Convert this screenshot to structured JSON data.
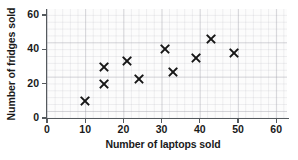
{
  "chart_data": {
    "type": "scatter",
    "title": "",
    "xlabel": "Number of laptops sold",
    "ylabel": "Number of fridges sold",
    "xlim": [
      0,
      63
    ],
    "ylim": [
      0,
      63
    ],
    "xticks": [
      0,
      10,
      20,
      30,
      40,
      50,
      60
    ],
    "xtick_labels": [
      "0",
      "10",
      "20",
      "30",
      "40",
      "50",
      "60"
    ],
    "yticks": [
      0,
      20,
      40,
      60
    ],
    "ytick_labels": [
      "0",
      "20",
      "40",
      "60"
    ],
    "grid": true,
    "grid_minor_step": 2,
    "grid_major_step": 10,
    "legend": null,
    "marker": "x",
    "marker_color": "#161616",
    "points": [
      {
        "x": 10,
        "y": 10
      },
      {
        "x": 15,
        "y": 20
      },
      {
        "x": 15,
        "y": 30
      },
      {
        "x": 21,
        "y": 33
      },
      {
        "x": 24,
        "y": 23
      },
      {
        "x": 31,
        "y": 40
      },
      {
        "x": 33,
        "y": 27
      },
      {
        "x": 39,
        "y": 35
      },
      {
        "x": 43,
        "y": 46
      },
      {
        "x": 49,
        "y": 38
      }
    ]
  },
  "colors": {
    "marker": "#161616",
    "axis": "#555a5e",
    "grid_major": "#96969f",
    "grid_minor": "#a0a0aa",
    "plot_background": "#fcfcfc",
    "page_background": "#ffffff",
    "text": "#1a1a1a"
  }
}
